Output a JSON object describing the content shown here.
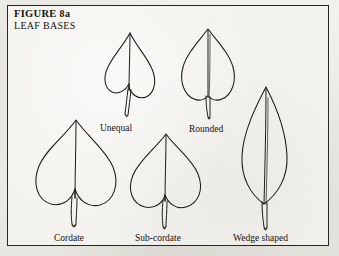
{
  "plate": {
    "figure_number": "FIGURE 8a",
    "figure_label_main": "FIGURE",
    "figure_label_suffix": "8a",
    "subject_title": "LEAF BASES",
    "border_color": "#2a2722",
    "paper_color": "#efeeea",
    "ink_color": "#1d1a16"
  },
  "specimens": [
    {
      "id": "unequal",
      "label": "Unequal",
      "base_type": "unequal",
      "description": "Heart-shaped blade whose two basal lobes are set at different heights, making the base asymmetric.",
      "row": "upper",
      "order": 1
    },
    {
      "id": "rounded",
      "label": "Rounded",
      "base_type": "rounded",
      "description": "Ovate blade with a smoothly rounded base and no notch, tapering to a pointed tip.",
      "row": "upper",
      "order": 2
    },
    {
      "id": "cordate",
      "label": "Cordate",
      "base_type": "cordate",
      "description": "Broad heart-shaped blade with a deep narrow sinus between two large rounded basal lobes.",
      "row": "lower",
      "order": 1
    },
    {
      "id": "sub-cordate",
      "label": "Sub-cordate",
      "base_type": "sub-cordate",
      "description": "Heart-shaped blade with a shallow sinus; basal lobes are less pronounced than in cordate.",
      "row": "lower",
      "order": 2
    },
    {
      "id": "wedge-shaped",
      "label": "Wedge shaped",
      "base_type": "cuneate",
      "description": "Elliptic to lanceolate blade tapering evenly into the petiole, forming a wedge at the base.",
      "row": "lower",
      "order": 3
    }
  ]
}
